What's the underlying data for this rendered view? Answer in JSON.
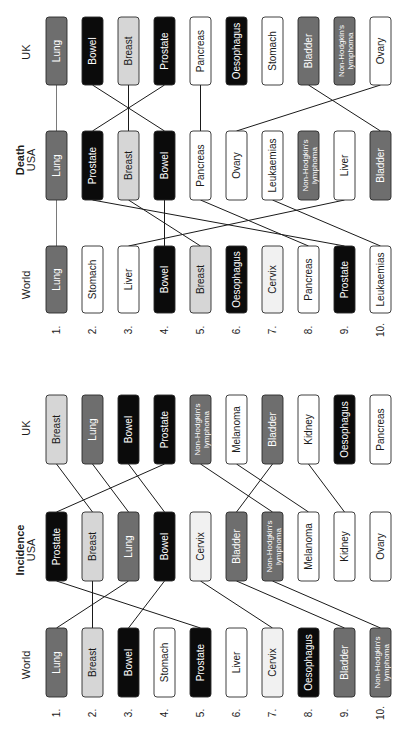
{
  "colors": {
    "dark_grey": "#6e6e6e",
    "black": "#0b0b0b",
    "light_grey": "#d6d6d6",
    "pale": "#f1f1f1",
    "white": "#ffffff",
    "line": "#1a1a1a",
    "lung_line": "#7a7a7a"
  },
  "rank_labels": [
    "1.",
    "2.",
    "3.",
    "4.",
    "5.",
    "6.",
    "7.",
    "8.",
    "9.",
    "10."
  ],
  "panels": [
    {
      "id": "death",
      "title": "Death",
      "columns": [
        {
          "label": "UK",
          "items": [
            {
              "name": "Lung",
              "fill": "dark_grey"
            },
            {
              "name": "Bowel",
              "fill": "black"
            },
            {
              "name": "Breast",
              "fill": "light_grey"
            },
            {
              "name": "Prostate",
              "fill": "black"
            },
            {
              "name": "Pancreas",
              "fill": "white"
            },
            {
              "name": "Oesophagus",
              "fill": "black"
            },
            {
              "name": "Stomach",
              "fill": "white"
            },
            {
              "name": "Bladder",
              "fill": "dark_grey"
            },
            {
              "name": "Non-Hodgkin's lymphoma",
              "fill": "dark_grey"
            },
            {
              "name": "Ovary",
              "fill": "white"
            }
          ]
        },
        {
          "label": "USA",
          "items": [
            {
              "name": "Lung",
              "fill": "dark_grey"
            },
            {
              "name": "Prostate",
              "fill": "black"
            },
            {
              "name": "Breast",
              "fill": "light_grey"
            },
            {
              "name": "Bowel",
              "fill": "black"
            },
            {
              "name": "Pancreas",
              "fill": "white"
            },
            {
              "name": "Ovary",
              "fill": "white"
            },
            {
              "name": "Leukaemias",
              "fill": "white"
            },
            {
              "name": "Non-Hodgkin's lymphoma",
              "fill": "dark_grey"
            },
            {
              "name": "Liver",
              "fill": "white"
            },
            {
              "name": "Bladder",
              "fill": "dark_grey"
            }
          ]
        },
        {
          "label": "World",
          "items": [
            {
              "name": "Lung",
              "fill": "dark_grey"
            },
            {
              "name": "Stomach",
              "fill": "white"
            },
            {
              "name": "Liver",
              "fill": "white"
            },
            {
              "name": "Bowel",
              "fill": "black"
            },
            {
              "name": "Breast",
              "fill": "light_grey"
            },
            {
              "name": "Oesophagus",
              "fill": "black"
            },
            {
              "name": "Cervix",
              "fill": "pale"
            },
            {
              "name": "Pancreas",
              "fill": "white"
            },
            {
              "name": "Prostate",
              "fill": "black"
            },
            {
              "name": "Leukaemias",
              "fill": "white"
            }
          ]
        }
      ],
      "links_uk_usa": [
        [
          1,
          1
        ],
        [
          2,
          4
        ],
        [
          3,
          3
        ],
        [
          4,
          2
        ],
        [
          5,
          5
        ],
        [
          10,
          6
        ],
        [
          8,
          10
        ]
      ],
      "links_usa_world": [
        [
          1,
          1
        ],
        [
          2,
          9
        ],
        [
          3,
          5
        ],
        [
          4,
          4
        ],
        [
          5,
          8
        ],
        [
          7,
          10
        ],
        [
          9,
          3
        ]
      ]
    },
    {
      "id": "incidence",
      "title": "Incidence",
      "columns": [
        {
          "label": "UK",
          "items": [
            {
              "name": "Breast",
              "fill": "light_grey"
            },
            {
              "name": "Lung",
              "fill": "dark_grey"
            },
            {
              "name": "Bowel",
              "fill": "black"
            },
            {
              "name": "Prostate",
              "fill": "black"
            },
            {
              "name": "Non-Hodgkin's lymphoma",
              "fill": "dark_grey"
            },
            {
              "name": "Melanoma",
              "fill": "white"
            },
            {
              "name": "Bladder",
              "fill": "dark_grey"
            },
            {
              "name": "Kidney",
              "fill": "white"
            },
            {
              "name": "Oesophagus",
              "fill": "black"
            },
            {
              "name": "Pancreas",
              "fill": "white"
            }
          ]
        },
        {
          "label": "USA",
          "items": [
            {
              "name": "Prostate",
              "fill": "black"
            },
            {
              "name": "Breast",
              "fill": "light_grey"
            },
            {
              "name": "Lung",
              "fill": "dark_grey"
            },
            {
              "name": "Bowel",
              "fill": "black"
            },
            {
              "name": "Cervix",
              "fill": "pale"
            },
            {
              "name": "Bladder",
              "fill": "dark_grey"
            },
            {
              "name": "Non-Hodgkin's lymphoma",
              "fill": "dark_grey"
            },
            {
              "name": "Melanoma",
              "fill": "white"
            },
            {
              "name": "Kidney",
              "fill": "white"
            },
            {
              "name": "Ovary",
              "fill": "white"
            }
          ]
        },
        {
          "label": "World",
          "items": [
            {
              "name": "Lung",
              "fill": "dark_grey"
            },
            {
              "name": "Breast",
              "fill": "light_grey"
            },
            {
              "name": "Bowel",
              "fill": "black"
            },
            {
              "name": "Stomach",
              "fill": "white"
            },
            {
              "name": "Prostate",
              "fill": "black"
            },
            {
              "name": "Liver",
              "fill": "white"
            },
            {
              "name": "Cervix",
              "fill": "pale"
            },
            {
              "name": "Oesophagus",
              "fill": "black"
            },
            {
              "name": "Bladder",
              "fill": "dark_grey"
            },
            {
              "name": "Non-Hodgkin's lymphoma",
              "fill": "dark_grey"
            }
          ]
        }
      ],
      "links_uk_usa": [
        [
          1,
          2
        ],
        [
          2,
          3
        ],
        [
          3,
          4
        ],
        [
          4,
          1
        ],
        [
          5,
          7
        ],
        [
          6,
          8
        ],
        [
          7,
          6
        ],
        [
          8,
          9
        ]
      ],
      "links_usa_world": [
        [
          1,
          5
        ],
        [
          2,
          2
        ],
        [
          3,
          1
        ],
        [
          4,
          3
        ],
        [
          5,
          7
        ],
        [
          6,
          9
        ],
        [
          7,
          10
        ]
      ]
    }
  ]
}
